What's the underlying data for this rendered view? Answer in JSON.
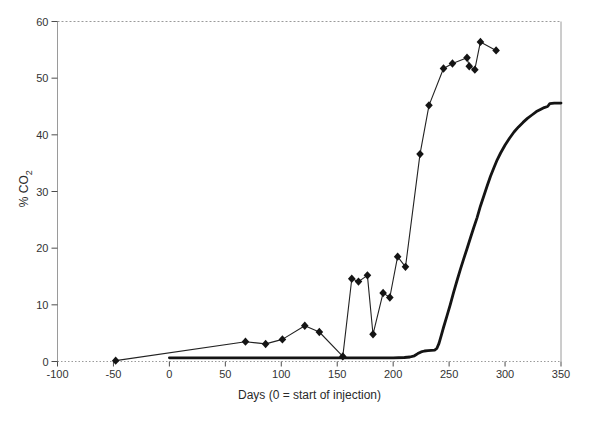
{
  "figure": {
    "background": "#ffffff",
    "line_color": "#141414",
    "thin_line_color": "#222222",
    "frame_color": "#9a9a9a",
    "tick_color": "#4d4d4d",
    "text_color": "#333333"
  },
  "chart_data": {
    "type": "line",
    "title": "",
    "xlabel": "Days (0 = start of injection)",
    "ylabel": "% CO2",
    "ylabel_base": "% CO",
    "ylabel_sub": "2",
    "xlim": [
      -100,
      350
    ],
    "ylim": [
      0,
      60
    ],
    "xticks": [
      -100,
      -50,
      0,
      50,
      100,
      150,
      200,
      250,
      300,
      350
    ],
    "yticks": [
      0,
      10,
      20,
      30,
      40,
      50,
      60
    ],
    "x_tick_labels": [
      "-100",
      "-50",
      "0",
      "50",
      "100",
      "150",
      "200",
      "250",
      "300",
      "350"
    ],
    "y_tick_labels": [
      "0",
      "10",
      "20",
      "30",
      "40",
      "50",
      "60"
    ],
    "grid": false,
    "legend": "none",
    "series": [
      {
        "name": "diamond_marker_series",
        "style": "thin-line-diamond-markers",
        "points": [
          [
            -48,
            0.15
          ],
          [
            68,
            3.5
          ],
          [
            86,
            3.1
          ],
          [
            101,
            3.9
          ],
          [
            121,
            6.3
          ],
          [
            134,
            5.2
          ],
          [
            155,
            0.9
          ],
          [
            163,
            14.6
          ],
          [
            169,
            14.1
          ],
          [
            177,
            15.2
          ],
          [
            182,
            4.8
          ],
          [
            191,
            12.1
          ],
          [
            197,
            11.3
          ],
          [
            204,
            18.5
          ],
          [
            211,
            16.7
          ],
          [
            224,
            36.6
          ],
          [
            232,
            45.2
          ],
          [
            245,
            51.7
          ],
          [
            253,
            52.6
          ],
          [
            266,
            53.6
          ],
          [
            268,
            52.1
          ],
          [
            273,
            51.5
          ],
          [
            278,
            56.4
          ],
          [
            292,
            54.9
          ]
        ]
      },
      {
        "name": "thick_line_series",
        "style": "thick-line",
        "points": [
          [
            0,
            0.65
          ],
          [
            30,
            0.65
          ],
          [
            60,
            0.65
          ],
          [
            90,
            0.65
          ],
          [
            120,
            0.65
          ],
          [
            150,
            0.65
          ],
          [
            180,
            0.65
          ],
          [
            200,
            0.65
          ],
          [
            210,
            0.7
          ],
          [
            215,
            0.8
          ],
          [
            219,
            1.0
          ],
          [
            222,
            1.4
          ],
          [
            225,
            1.7
          ],
          [
            228,
            1.85
          ],
          [
            231,
            1.9
          ],
          [
            234,
            1.95
          ],
          [
            237,
            2.0
          ],
          [
            239,
            2.3
          ],
          [
            241,
            3.2
          ],
          [
            243,
            4.6
          ],
          [
            245,
            6.0
          ],
          [
            248,
            8.0
          ],
          [
            251,
            10.0
          ],
          [
            254,
            12.2
          ],
          [
            257,
            14.2
          ],
          [
            260,
            16.2
          ],
          [
            263,
            18.1
          ],
          [
            266,
            19.9
          ],
          [
            269,
            21.8
          ],
          [
            272,
            23.6
          ],
          [
            275,
            25.4
          ],
          [
            278,
            27.4
          ],
          [
            281,
            29.2
          ],
          [
            284,
            31.0
          ],
          [
            287,
            32.7
          ],
          [
            290,
            34.2
          ],
          [
            293,
            35.6
          ],
          [
            296,
            36.8
          ],
          [
            300,
            38.2
          ],
          [
            304,
            39.4
          ],
          [
            308,
            40.5
          ],
          [
            312,
            41.4
          ],
          [
            316,
            42.2
          ],
          [
            320,
            42.9
          ],
          [
            324,
            43.5
          ],
          [
            328,
            44.1
          ],
          [
            332,
            44.5
          ],
          [
            335,
            44.8
          ],
          [
            338,
            45.0
          ],
          [
            340,
            45.5
          ],
          [
            344,
            45.6
          ],
          [
            350,
            45.6
          ]
        ]
      }
    ]
  }
}
